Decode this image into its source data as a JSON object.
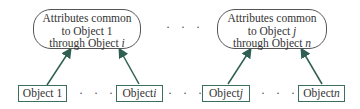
{
  "groups": [
    {
      "bubble": {
        "line1": "Attributes common",
        "line2": "to Object 1",
        "line3_prefix": "through Object ",
        "line3_var": "i"
      },
      "objects": [
        {
          "prefix": "Object ",
          "var": "1",
          "italic": false
        },
        {
          "prefix": "Object",
          "var": "i",
          "italic": true
        }
      ]
    },
    {
      "bubble": {
        "line1": "Attributes common",
        "line2_prefix": "to Object ",
        "line2_var": "j",
        "line3_prefix": "through Object ",
        "line3_var": "n"
      },
      "objects": [
        {
          "prefix": "Object",
          "var": "j",
          "italic": true
        },
        {
          "prefix": "Object",
          "var": "n",
          "italic": true
        }
      ]
    }
  ],
  "ellipsis": "· · ·",
  "colors": {
    "arrow": "#2f5f52",
    "box_border": "#3c6e60",
    "bubble_border": "#555555"
  }
}
